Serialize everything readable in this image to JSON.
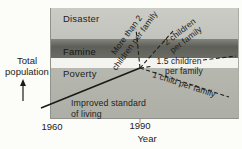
{
  "figure": {
    "y_axis": {
      "label_line1": "Total",
      "label_line2": "population"
    },
    "x_axis": {
      "label": "Year",
      "ticks": [
        "1960",
        "1990"
      ]
    },
    "bands": [
      {
        "label": "Disaster",
        "color": "#c6c7c1"
      },
      {
        "label": "Famine",
        "color": "#63655e"
      },
      {
        "label": "Poverty",
        "color": "#b2b4ac"
      }
    ],
    "gap_color": "#f3f3ef",
    "scenarios": {
      "more_than_two": {
        "line1": "More than 2",
        "line2": "children per family",
        "style": "dashed"
      },
      "two": {
        "line1": "2 children",
        "line2": "per family",
        "style": "dashed"
      },
      "one_point_five": {
        "line1": "1.5 children",
        "line2": "per family",
        "style": "dashed"
      },
      "one_child": {
        "label": "1 child per family",
        "style": "dashed"
      },
      "improved": {
        "line1": "Improved standard",
        "line2": "of living",
        "style": "solid"
      }
    },
    "line_color": "#1f1f1d",
    "background_color": "#fcfcf9",
    "text_color": "#232321"
  }
}
